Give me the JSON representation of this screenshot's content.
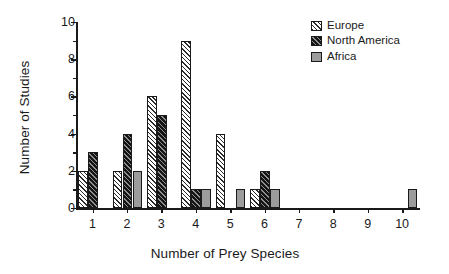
{
  "chart_data": {
    "type": "bar",
    "title": "",
    "xlabel": "Number of Prey Species",
    "ylabel": "Number of Studies",
    "categories": [
      "1",
      "2",
      "3",
      "4",
      "5",
      "6",
      "7",
      "8",
      "9",
      "10"
    ],
    "series": [
      {
        "name": "Europe",
        "values": [
          2,
          2,
          6,
          9,
          4,
          1,
          0,
          0,
          0,
          0
        ],
        "fill": "light-diagonal-hatch",
        "color": "#ffffff"
      },
      {
        "name": "North America",
        "values": [
          3,
          4,
          5,
          1,
          0,
          2,
          0,
          0,
          0,
          0
        ],
        "fill": "dark-diagonal-hatch",
        "color": "#151515"
      },
      {
        "name": "Africa",
        "values": [
          0,
          2,
          0,
          1,
          1,
          1,
          0,
          0,
          0,
          1
        ],
        "fill": "solid-gray",
        "color": "#9c9c9c"
      }
    ],
    "ylim": [
      0,
      10
    ],
    "y_major_ticks": [
      0,
      2,
      4,
      6,
      8,
      10
    ],
    "y_minor_ticks": [
      1,
      3,
      5,
      7,
      9
    ],
    "y_tick_labels": [
      "0",
      "2",
      "4",
      "6",
      "8",
      "10"
    ],
    "grid": false,
    "legend_position": "top-right"
  },
  "legend": {
    "entries": [
      {
        "label": "Europe"
      },
      {
        "label": "North America"
      },
      {
        "label": "Africa"
      }
    ]
  },
  "axes": {
    "x_title": "Number of Prey Species",
    "y_title": "Number of Studies"
  }
}
